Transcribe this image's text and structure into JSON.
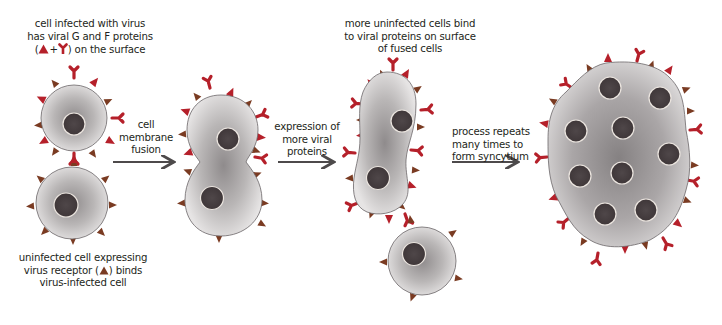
{
  "diagram": {
    "type": "process-flow",
    "colors": {
      "g_protein": "#b5202a",
      "f_protein": "#b5202a",
      "receptor": "#7a3b22",
      "cell_membrane": "#6b6668",
      "cytoplasm_center": "#8e8a8b",
      "cytoplasm_edge": "#e4e2e2",
      "nucleus": "#4a4244",
      "nucleus_ring": "#e8e2dc",
      "arrow": "#4d4a4b",
      "text": "#231f20"
    },
    "labels": {
      "infected_cell": {
        "line1": "cell infected with virus",
        "line2": "has viral G and F proteins",
        "line3_open": "(",
        "line3_plus": "+",
        "line3_close": ") on the surface"
      },
      "uninfected_cell": {
        "line1": "uninfected cell expressing",
        "line2_pre": "virus receptor (",
        "line2_post": ") binds",
        "line3": "virus-infected cell"
      },
      "step1": {
        "line1": "cell",
        "line2": "membrane",
        "line3": "fusion"
      },
      "step2": {
        "line1": "expression of",
        "line2": "more viral",
        "line3": "proteins"
      },
      "step3_top": {
        "line1": "more uninfected cells bind",
        "line2": "to viral proteins on surface",
        "line3": "of fused cells"
      },
      "step3": {
        "line1": "process repeats",
        "line2": "many times to",
        "line3": "form syncytium"
      }
    },
    "stages": [
      {
        "id": "stage-1",
        "description": "infected cell bound to uninfected cell",
        "cells": 2,
        "nuclei": 2
      },
      {
        "id": "stage-2",
        "description": "fused cell with two nuclei",
        "cells": 1,
        "nuclei": 2
      },
      {
        "id": "stage-3",
        "description": "fused cell with more viral proteins and a new uninfected cell binding",
        "cells": 2,
        "nuclei": 3
      },
      {
        "id": "stage-4",
        "description": "syncytium",
        "cells": 1,
        "nuclei": 9
      }
    ],
    "arrows": [
      {
        "from": "stage-1",
        "to": "stage-2"
      },
      {
        "from": "stage-2",
        "to": "stage-3"
      },
      {
        "from": "stage-3",
        "to": "stage-4"
      }
    ]
  }
}
